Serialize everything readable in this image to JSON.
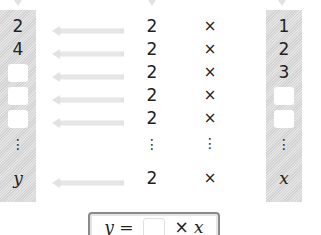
{
  "diagram": {
    "left_column_label": "y values",
    "right_column_label": "x values",
    "rows": [
      {
        "y": "2",
        "factor": "2",
        "op": "×",
        "x": "1",
        "y_blank": false,
        "x_blank": false
      },
      {
        "y": "4",
        "factor": "2",
        "op": "×",
        "x": "2",
        "y_blank": false,
        "x_blank": false
      },
      {
        "y": "",
        "factor": "2",
        "op": "×",
        "x": "3",
        "y_blank": true,
        "x_blank": false
      },
      {
        "y": "",
        "factor": "2",
        "op": "×",
        "x": "",
        "y_blank": true,
        "x_blank": true
      },
      {
        "y": "",
        "factor": "2",
        "op": "×",
        "x": "",
        "y_blank": true,
        "x_blank": true
      },
      {
        "y": "⋮",
        "factor": "⋮",
        "op": "⋮",
        "x": "⋮",
        "ellipsis": true
      },
      {
        "y": "y",
        "factor": "2",
        "op": "×",
        "x": "x",
        "variable": true
      }
    ],
    "formula": {
      "lhs": "y =",
      "blank": "",
      "rhs_op": "×",
      "rhs_var": "x"
    },
    "colors": {
      "strip": "#d8d8d8",
      "arrow": "#e0e0e0",
      "text": "#222222",
      "formula_border": "#8a8a8a"
    }
  }
}
